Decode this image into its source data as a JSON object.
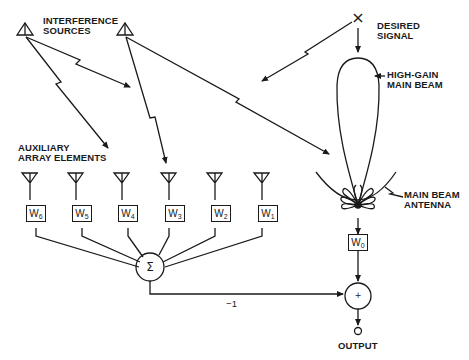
{
  "diagram": {
    "type": "adaptive sidelobe canceller block diagram",
    "labels": {
      "interference_sources": "INTERFERENCE\nSOURCES",
      "desired_signal": "DESIRED\nSIGNAL",
      "high_gain_main_beam": "HIGH-GAIN\nMAIN BEAM",
      "auxiliary_array_elements": "AUXILIARY\nARRAY ELEMENTS",
      "main_beam_antenna": "MAIN BEAM\nANTENNA",
      "output": "OUTPUT",
      "negation_gain": "−1"
    },
    "auxiliary_weights": [
      {
        "base": "W",
        "sub": "6"
      },
      {
        "base": "W",
        "sub": "5"
      },
      {
        "base": "W",
        "sub": "4"
      },
      {
        "base": "W",
        "sub": "3"
      },
      {
        "base": "W",
        "sub": "2"
      },
      {
        "base": "W",
        "sub": "1"
      }
    ],
    "main_weight": {
      "base": "W",
      "sub": "0"
    },
    "summer_symbol": "Σ",
    "adder_symbol": "+",
    "desired_signal_marker": "×",
    "colors": {
      "line": "#1a1a1a",
      "background": "#ffffff"
    }
  }
}
